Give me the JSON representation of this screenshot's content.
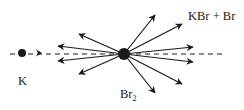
{
  "diagram": {
    "colors": {
      "ink": "#1a1a1a",
      "background": "#ffffff"
    },
    "particles": {
      "projectile": {
        "label": "K",
        "x": 22,
        "y": 53,
        "r": 4
      },
      "target": {
        "label": "Br",
        "label_subscript": "2",
        "x": 124,
        "y": 54,
        "r": 6
      }
    },
    "products_label": "KBr + Br",
    "beam_line": {
      "x1": 10,
      "x2": 224,
      "y": 54,
      "dash": "5,4"
    },
    "incoming_arrow": {
      "x": 42,
      "y": 53
    },
    "scattered_arrows": [
      {
        "x": 155,
        "y": 15
      },
      {
        "x": 182,
        "y": 24
      },
      {
        "x": 193,
        "y": 47
      },
      {
        "x": 193,
        "y": 62
      },
      {
        "x": 182,
        "y": 84
      },
      {
        "x": 155,
        "y": 93
      },
      {
        "x": 79,
        "y": 34
      },
      {
        "x": 58,
        "y": 46
      },
      {
        "x": 58,
        "y": 61
      },
      {
        "x": 79,
        "y": 74
      }
    ]
  }
}
